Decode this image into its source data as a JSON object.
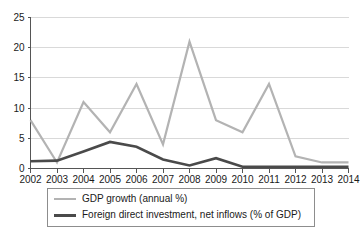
{
  "chart_data": {
    "type": "line",
    "title": "",
    "xlabel": "",
    "ylabel": "",
    "x": [
      2002,
      2003,
      2004,
      2005,
      2006,
      2007,
      2008,
      2009,
      2010,
      2011,
      2012,
      2013,
      2014
    ],
    "categories": [
      "2002",
      "2003",
      "2004",
      "2005",
      "2006",
      "2007",
      "2008",
      "2009",
      "2010",
      "2011",
      "2012",
      "2013",
      "2014"
    ],
    "series": [
      {
        "name": "GDP growth (annual %)",
        "color": "#b3b3b3",
        "width": 2.2,
        "values": [
          8.0,
          1.0,
          11.0,
          6.0,
          14.0,
          4.0,
          21.0,
          8.0,
          6.0,
          14.0,
          2.0,
          1.0,
          1.0
        ]
      },
      {
        "name": "Foreign direct investment, net inflows (% of GDP)",
        "color": "#4a4a4a",
        "width": 2.6,
        "values": [
          1.2,
          1.3,
          2.8,
          4.4,
          3.6,
          1.5,
          0.5,
          1.7,
          0.3,
          0.3,
          0.3,
          0.3,
          0.3
        ]
      }
    ],
    "ylim": [
      0,
      25
    ],
    "yticks": [
      0,
      5,
      10,
      15,
      20,
      25
    ],
    "ytick_labels": [
      "0",
      "5",
      "10",
      "15",
      "20",
      "25"
    ],
    "xlim": [
      2002,
      2014
    ],
    "grid": true,
    "grid_axis": "y",
    "legend_position": "below-axes"
  },
  "legend": {
    "items": [
      {
        "label": "GDP growth (annual %)"
      },
      {
        "label": "Foreign direct investment, net inflows (% of GDP)"
      }
    ]
  }
}
